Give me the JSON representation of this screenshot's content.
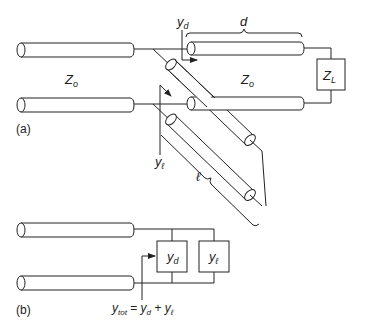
{
  "figure": {
    "panel_a": {
      "label": "(a)",
      "line_impedance_left": "Z",
      "line_impedance_left_sub": "o",
      "line_impedance_right": "Z",
      "line_impedance_right_sub": "o",
      "load": "Z",
      "load_sub": "L",
      "distance_label": "d",
      "stub_length_label": "ℓ",
      "admittance_d": "y",
      "admittance_d_sub": "d",
      "admittance_l": "y",
      "admittance_l_sub": "ℓ"
    },
    "panel_b": {
      "label": "(b)",
      "box_d": "y",
      "box_d_sub": "d",
      "box_l": "y",
      "box_l_sub": "ℓ",
      "equation_lhs": "y",
      "equation_lhs_sub": "tot",
      "equation_eq": " = ",
      "equation_t1": "y",
      "equation_t1_sub": "d",
      "equation_plus": " + ",
      "equation_t2": "y",
      "equation_t2_sub": "ℓ"
    },
    "colors": {
      "stroke": "#222222",
      "background": "#ffffff"
    }
  }
}
